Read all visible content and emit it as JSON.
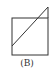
{
  "figure": {
    "label": "(B)",
    "stroke_color": "#333333",
    "shapes": {
      "square": {
        "x": 12,
        "y": 18,
        "width": 36,
        "height": 37
      },
      "diagonal": {
        "x1": 12,
        "y1": 46,
        "x2": 48,
        "y2": 7
      },
      "extension": {
        "x1": 48,
        "y1": 7,
        "x2": 48,
        "y2": 18
      }
    }
  }
}
